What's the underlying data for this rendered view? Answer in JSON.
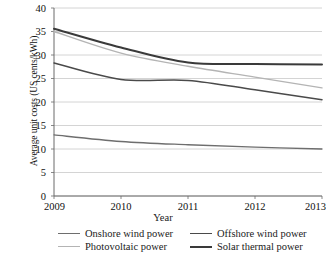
{
  "chart_data": {
    "type": "line",
    "title": "",
    "xlabel": "Year",
    "ylabel": "Average unit costs (US cents/kWh)",
    "x": [
      2009,
      2010,
      2011,
      2012,
      2013
    ],
    "xticklabels": [
      "2009",
      "2010",
      "2011",
      "2012",
      "2013"
    ],
    "yticklabels": [
      "0",
      "5",
      "10",
      "15",
      "20",
      "25",
      "30",
      "35",
      "40"
    ],
    "yticks": [
      0,
      5,
      10,
      15,
      20,
      25,
      30,
      35,
      40
    ],
    "ylim": [
      0,
      40
    ],
    "xlim": [
      2009,
      2013
    ],
    "grid": "horizontal",
    "legend_position": "bottom",
    "series": [
      {
        "name": "Onshore wind power",
        "values": [
          13.0,
          11.6,
          10.9,
          10.4,
          10.0
        ],
        "color": "#6e6e6e",
        "width": 1.3
      },
      {
        "name": "Offshore wind power",
        "values": [
          28.3,
          24.8,
          24.6,
          22.6,
          20.5
        ],
        "color": "#4a4a4a",
        "width": 1.5
      },
      {
        "name": "Photovoltaic power",
        "values": [
          35.0,
          30.4,
          27.6,
          25.3,
          23.0
        ],
        "color": "#b4b4b4",
        "width": 1.4
      },
      {
        "name": "Solar thermal power",
        "values": [
          35.6,
          31.6,
          28.4,
          28.1,
          28.0
        ],
        "color": "#3a3a3a",
        "width": 2.0
      }
    ]
  },
  "axes": {
    "ylabel": "Average unit costs (US cents/kWh)",
    "xlabel": "Year"
  },
  "legend": {
    "items": [
      {
        "label": "Onshore wind power",
        "color": "#6e6e6e",
        "width": 1.3
      },
      {
        "label": "Offshore wind power",
        "color": "#4a4a4a",
        "width": 1.5
      },
      {
        "label": "Photovoltaic power",
        "color": "#b4b4b4",
        "width": 1.4
      },
      {
        "label": "Solar thermal power",
        "color": "#3a3a3a",
        "width": 2.0
      }
    ]
  },
  "caption": {
    "text": ""
  }
}
